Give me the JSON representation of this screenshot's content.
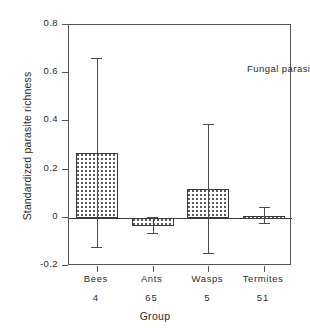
{
  "chart_data": {
    "type": "bar",
    "title": "",
    "annotation": "Fungal parasites",
    "xlabel": "Group",
    "ylabel": "Standardized parasite richness",
    "categories": [
      "Bees",
      "Ants",
      "Wasps",
      "Termites"
    ],
    "sample_sizes": [
      "4",
      "65",
      "5",
      "51"
    ],
    "values": [
      0.27,
      -0.035,
      0.12,
      0.008
    ],
    "error_low": [
      -0.12,
      -0.065,
      -0.145,
      -0.02
    ],
    "error_high": [
      0.665,
      0.005,
      0.39,
      0.045
    ],
    "ylim": [
      -0.2,
      0.8
    ],
    "yticks": [
      0.8,
      0.6,
      0.4,
      0.2,
      0,
      -0.2
    ],
    "ytick_labels": [
      "0.8",
      "0.6",
      "0.4",
      "0.2",
      "0",
      "-0.2"
    ],
    "grid": false,
    "legend": "none",
    "zero_reference_line": true,
    "bar_fill": "dotted-hatch",
    "colors": {
      "axis": "#555555",
      "bar_edge": "#3a3a3a",
      "bar_pattern": "#555555",
      "error_bar": "#4a4a4a",
      "text": "#2b2b2b",
      "background": "#ffffff"
    }
  }
}
